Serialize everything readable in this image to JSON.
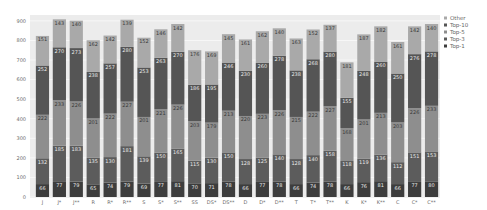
{
  "chart_data": {
    "type": "bar",
    "stacked": true,
    "title": "",
    "xlabel": "",
    "ylabel": "",
    "ylim": [
      0,
      930
    ],
    "yticks": [
      0,
      100,
      200,
      300,
      400,
      500,
      600,
      700,
      800,
      900
    ],
    "grid": true,
    "legend_position": "right",
    "categories": [
      "J",
      "J*",
      "J**",
      "R",
      "R*",
      "R**",
      "S",
      "S*",
      "S**",
      "SS",
      "DS*",
      "DS**",
      "D",
      "D*",
      "D**",
      "T",
      "T*",
      "T**",
      "K",
      "K*",
      "K**",
      "C",
      "C*",
      "C**"
    ],
    "series": [
      {
        "name": "Top-1",
        "color": "#3d3d3d",
        "values": [
          66,
          77,
          79,
          65,
          74,
          79,
          69,
          77,
          81,
          70,
          71,
          78,
          66,
          77,
          78,
          66,
          74,
          78,
          66,
          76,
          81,
          66,
          77,
          80
        ]
      },
      {
        "name": "Top-3",
        "color": "#5c5c5c",
        "values": [
          132,
          185,
          183,
          135,
          130,
          181,
          139,
          150,
          165,
          115,
          130,
          150,
          128,
          125,
          140,
          128,
          140,
          158,
          118,
          119,
          136,
          112,
          151,
          153
        ]
      },
      {
        "name": "Top-5",
        "color": "#8e8e8e",
        "values": [
          222,
          233,
          226,
          201,
          222,
          227,
          201,
          221,
          226,
          203,
          179,
          213,
          220,
          223,
          226,
          215,
          222,
          227,
          168,
          201,
          213,
          203,
          226,
          233
        ]
      },
      {
        "name": "Top-10",
        "color": "#555555",
        "values": [
          252,
          270,
          273,
          238,
          257,
          280,
          253,
          263,
          270,
          186,
          195,
          246,
          230,
          260,
          278,
          238,
          268,
          280,
          155,
          248,
          260,
          250,
          276,
          278
        ]
      },
      {
        "name": "Other",
        "color": "#a9a9a9",
        "values": [
          151,
          143,
          140,
          162,
          142,
          139,
          152,
          146,
          142,
          176,
          169,
          145,
          161,
          162,
          140,
          163,
          152,
          137,
          181,
          187,
          182,
          161,
          142,
          140
        ]
      }
    ]
  },
  "legend": {
    "items": [
      {
        "label": "Other",
        "color": "#a9a9a9"
      },
      {
        "label": "Top-10",
        "color": "#555555"
      },
      {
        "label": "Top-5",
        "color": "#8e8e8e"
      },
      {
        "label": "Top-3",
        "color": "#5c5c5c"
      },
      {
        "label": "Top-1",
        "color": "#3d3d3d"
      }
    ]
  }
}
